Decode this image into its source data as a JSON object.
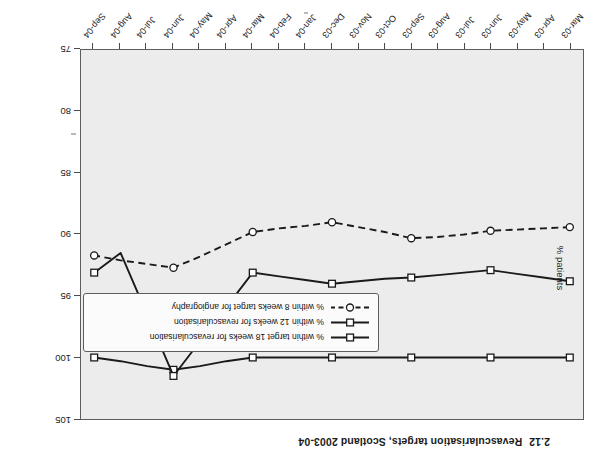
{
  "title": {
    "number": "2.12",
    "text": "Revascularisation targets, Scotland 2003-04"
  },
  "axes": {
    "y_title": "% patients",
    "y_ticks": [
      "75",
      "80",
      "85",
      "90",
      "95",
      "100",
      "105"
    ],
    "y_min": 75,
    "y_max": 105,
    "x_ticks": [
      "Mar-03",
      "Apr-03",
      "May-03",
      "Jun-03",
      "Jul-03",
      "Aug-03",
      "Sep-03",
      "Oct-03",
      "Nov-03",
      "Dec-03",
      "Jan-04",
      "Feb-04",
      "Mar-04",
      "Apr-04",
      "May-04",
      "Jun-04",
      "Jul-04",
      "Aug-04",
      "Sep-04"
    ]
  },
  "legend": [
    {
      "label": "% within target 18 weeks for revascularisation",
      "style": "solid",
      "marker": "square"
    },
    {
      "label": "% within 12 weeks for revascularisation",
      "style": "solid",
      "marker": "square"
    },
    {
      "label": "% within 8 weeks target for angiography",
      "style": "dashed",
      "marker": "circle"
    }
  ],
  "colors": {
    "plot_background": "#ececec",
    "frame": "#5d5d5d",
    "series": "#1a1a1a",
    "text": "#1d1d1d"
  },
  "chart_data": {
    "type": "line",
    "xlabel": "",
    "ylabel": "% patients",
    "ylim": [
      75,
      105
    ],
    "grid": false,
    "legend_position": "inside-upper-right",
    "x": [
      "Mar-03",
      "Apr-03",
      "May-03",
      "Jun-03",
      "Jul-03",
      "Aug-03",
      "Sep-03",
      "Oct-03",
      "Nov-03",
      "Dec-03",
      "Jan-04",
      "Feb-04",
      "Mar-04",
      "Apr-04",
      "May-04",
      "Jun-04",
      "Jul-04",
      "Aug-04",
      "Sep-04"
    ],
    "marker_x": [
      "Mar-03",
      "Jun-03",
      "Sep-03",
      "Dec-03",
      "Mar-04",
      "Jun-04",
      "Sep-04"
    ],
    "series": [
      {
        "name": "% within target 18 weeks for revascularisation",
        "style": "solid",
        "marker": "square",
        "values": [
          100.0,
          100.0,
          100.0,
          100.0,
          100.0,
          100.0,
          100.0,
          100.0,
          100.0,
          100.0,
          100.0,
          100.0,
          100.0,
          100.3,
          100.7,
          101.0,
          100.7,
          100.3,
          100.0
        ],
        "marker_values": [
          100.0,
          100.0,
          100.0,
          100.0,
          100.0,
          101.0,
          100.0
        ]
      },
      {
        "name": "% within 12 weeks for revascularisation",
        "style": "solid",
        "marker": "square",
        "values": [
          93.8,
          93.5,
          93.2,
          92.9,
          93.1,
          93.3,
          93.5,
          93.6,
          93.8,
          94.0,
          93.7,
          93.4,
          93.1,
          95.9,
          98.7,
          101.5,
          96.5,
          91.5,
          93.1
        ],
        "marker_values": [
          93.8,
          92.9,
          93.5,
          94.0,
          93.1,
          101.5,
          93.1
        ]
      },
      {
        "name": "% within 8 weeks target for angiography",
        "style": "dashed",
        "marker": "circle",
        "values": [
          89.4,
          89.5,
          89.6,
          89.7,
          90.0,
          90.2,
          90.3,
          89.8,
          89.4,
          89.0,
          89.3,
          89.5,
          89.8,
          90.8,
          91.8,
          92.7,
          92.4,
          92.1,
          91.7
        ],
        "marker_values": [
          89.4,
          89.7,
          90.3,
          89.0,
          89.8,
          92.7,
          91.7
        ]
      }
    ]
  }
}
